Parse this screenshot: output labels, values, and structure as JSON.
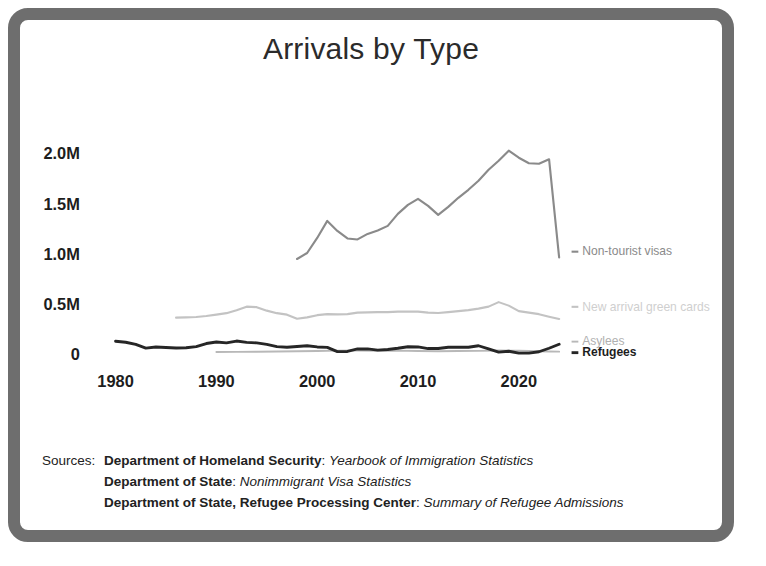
{
  "chart_data": {
    "type": "line",
    "title": "Arrivals by Type",
    "xlabel": "",
    "ylabel": "",
    "xlim": [
      1978,
      2025
    ],
    "ylim": [
      0,
      2200000
    ],
    "grid": false,
    "legend_position": "right-inline",
    "x_ticks": [
      1980,
      1990,
      2000,
      2010,
      2020
    ],
    "x_tick_labels": [
      "1980",
      "1990",
      "2000",
      "2010",
      "2020"
    ],
    "y_ticks": [
      0,
      500000,
      1000000,
      1500000,
      2000000
    ],
    "y_tick_labels": [
      "0",
      "0.5M",
      "1.0M",
      "1.5M",
      "2.0M"
    ],
    "series": [
      {
        "name": "Non-tourist visas",
        "color": "#8a8a8a",
        "width": 2.2,
        "label_color": "#8a8a8a",
        "label_weight": "normal",
        "label_x": 2026,
        "label_y": 985000,
        "x": [
          1998,
          1999,
          2000,
          2001,
          2002,
          2003,
          2004,
          2005,
          2006,
          2007,
          2008,
          2009,
          2010,
          2011,
          2012,
          2013,
          2014,
          2015,
          2016,
          2017,
          2018,
          2019,
          2020,
          2021,
          2022,
          2023,
          2024
        ],
        "y": [
          950000,
          1010000,
          1160000,
          1330000,
          1230000,
          1155000,
          1145000,
          1200000,
          1235000,
          1280000,
          1400000,
          1490000,
          1550000,
          1480000,
          1390000,
          1470000,
          1560000,
          1640000,
          1730000,
          1840000,
          1930000,
          2030000,
          1960000,
          1905000,
          1900000,
          1945000,
          965000
        ]
      },
      {
        "name": "New arrival green cards",
        "color": "#c3c3c3",
        "width": 2.2,
        "label_color": "#cfcfcf",
        "label_weight": "normal",
        "label_x": 2026,
        "label_y": 435000,
        "x": [
          1986,
          1987,
          1988,
          1989,
          1990,
          1991,
          1992,
          1993,
          1994,
          1995,
          1996,
          1997,
          1998,
          1999,
          2000,
          2001,
          2002,
          2003,
          2004,
          2005,
          2006,
          2007,
          2008,
          2009,
          2010,
          2011,
          2012,
          2013,
          2014,
          2015,
          2016,
          2017,
          2018,
          2019,
          2020,
          2021,
          2022,
          2023,
          2024
        ],
        "y": [
          365000,
          368000,
          372000,
          382000,
          395000,
          410000,
          440000,
          475000,
          470000,
          435000,
          410000,
          395000,
          355000,
          368000,
          390000,
          400000,
          398000,
          400000,
          415000,
          418000,
          420000,
          420000,
          425000,
          425000,
          425000,
          415000,
          412000,
          420000,
          430000,
          440000,
          455000,
          475000,
          520000,
          485000,
          430000,
          415000,
          400000,
          375000,
          352000
        ]
      },
      {
        "name": "Asylees",
        "color": "#b8b8b8",
        "width": 2.0,
        "label_color": "#b0b0b0",
        "label_weight": "normal",
        "label_x": 2026,
        "label_y": 88000,
        "x": [
          1990,
          1992,
          1994,
          1996,
          1998,
          2000,
          2002,
          2004,
          2006,
          2008,
          2010,
          2012,
          2014,
          2016,
          2018,
          2020,
          2021,
          2022,
          2023,
          2024
        ],
        "y": [
          22000,
          24000,
          25000,
          27000,
          30000,
          32000,
          36000,
          38000,
          34000,
          36000,
          33000,
          30000,
          32000,
          34000,
          38000,
          35000,
          33000,
          30000,
          28000,
          26000
        ]
      },
      {
        "name": "Refugees",
        "color": "#262626",
        "width": 3.0,
        "label_color": "#1d1d1d",
        "label_weight": "bold",
        "label_x": 2026,
        "label_y": -22000,
        "x": [
          1980,
          1981,
          1982,
          1983,
          1984,
          1985,
          1986,
          1987,
          1988,
          1989,
          1990,
          1991,
          1992,
          1993,
          1994,
          1995,
          1996,
          1997,
          1998,
          1999,
          2000,
          2001,
          2002,
          2003,
          2004,
          2005,
          2006,
          2007,
          2008,
          2009,
          2010,
          2011,
          2012,
          2013,
          2014,
          2015,
          2016,
          2017,
          2018,
          2019,
          2020,
          2021,
          2022,
          2023,
          2024
        ],
        "y": [
          130000,
          120000,
          98000,
          62000,
          72000,
          68000,
          62000,
          65000,
          76000,
          107000,
          122000,
          113000,
          132000,
          119000,
          113000,
          99000,
          76000,
          70000,
          77000,
          85000,
          73000,
          69000,
          27000,
          28000,
          53000,
          54000,
          41000,
          48000,
          60000,
          75000,
          73000,
          57000,
          58000,
          70000,
          70000,
          70000,
          85000,
          53000,
          22000,
          30000,
          12000,
          11000,
          25000,
          60000,
          100000
        ]
      }
    ]
  },
  "sources": {
    "lead": "Sources:",
    "lines": [
      {
        "bold": "Department of Homeland Security",
        "sep": ": ",
        "italic": "Yearbook of Immigration Statistics"
      },
      {
        "bold": "Department of State",
        "sep": ": ",
        "italic": "Nonimmigrant Visa Statistics"
      },
      {
        "bold": "Department of State, Refugee Processing Center",
        "sep": ": ",
        "italic": "Summary of Refugee Admissions"
      }
    ]
  }
}
